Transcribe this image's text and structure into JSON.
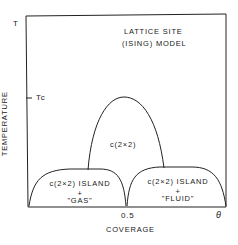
{
  "diagram": {
    "y_axis_top_label": "T",
    "y_axis_title": "TEMPERATURE",
    "tc_label": "Tc",
    "model_title_line1": "LATTICE SITE",
    "model_title_line2": "(ISING) MODEL",
    "x_axis_title": "COVERAGE",
    "x_tick_mid": "0.5",
    "x_axis_end_label": "θ",
    "regions": [
      {
        "id": "ordered",
        "label": "c(2×2)"
      },
      {
        "id": "left",
        "line1": "c(2×2) ISLAND",
        "line2": "+",
        "line3": "\"GAS\""
      },
      {
        "id": "right",
        "line1": "c(2×2) ISLAND",
        "line2": "+",
        "line3": "\"FLUID\""
      }
    ]
  }
}
